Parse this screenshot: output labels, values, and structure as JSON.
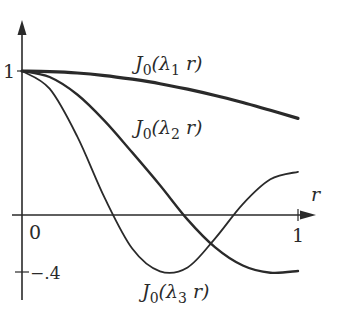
{
  "chart_data": {
    "type": "line",
    "title": "",
    "xlabel": "r",
    "ylabel": "",
    "xlim": [
      0,
      1
    ],
    "ylim": [
      -0.4,
      1
    ],
    "grid": false,
    "legend": "inline labels",
    "x_ticks": [
      "0",
      "1"
    ],
    "y_ticks": [
      "1",
      "-.4"
    ],
    "x": [
      0,
      0.1,
      0.2,
      0.3,
      0.4,
      0.5,
      0.6,
      0.7,
      0.8,
      0.9,
      1.0
    ],
    "series": [
      {
        "name": "J0(λ1 r)",
        "label_main": "J",
        "label_sub": "0",
        "label_arg": "(λ",
        "label_arg_sub": "1",
        "label_tail": " r)",
        "width": 3.2,
        "values": [
          1,
          0.996,
          0.986,
          0.968,
          0.943,
          0.912,
          0.874,
          0.83,
          0.781,
          0.727,
          0.671
        ]
      },
      {
        "name": "J0(λ2 r)",
        "label_main": "J",
        "label_sub": "0",
        "label_arg": "(λ",
        "label_arg_sub": "2",
        "label_tail": " r)",
        "width": 2.4,
        "values": [
          1,
          0.958,
          0.837,
          0.652,
          0.433,
          0.207,
          -0.032,
          -0.225,
          -0.351,
          -0.401,
          -0.389
        ]
      },
      {
        "name": "J0(λ3 r)",
        "label_main": "J",
        "label_sub": "0",
        "label_arg": "(λ",
        "label_arg_sub": "3",
        "label_tail": " r)",
        "width": 1.8,
        "values": [
          1,
          0.877,
          0.546,
          0.117,
          -0.235,
          -0.391,
          -0.364,
          -0.162,
          0.076,
          0.248,
          0.3
        ]
      }
    ]
  },
  "labels": {
    "y_one": "1",
    "y_neg": "−.4",
    "x_zero": "0",
    "x_one": "1",
    "x_axis": "r"
  },
  "colors": {
    "ink": "#2a2a2a",
    "background": "#ffffff"
  }
}
